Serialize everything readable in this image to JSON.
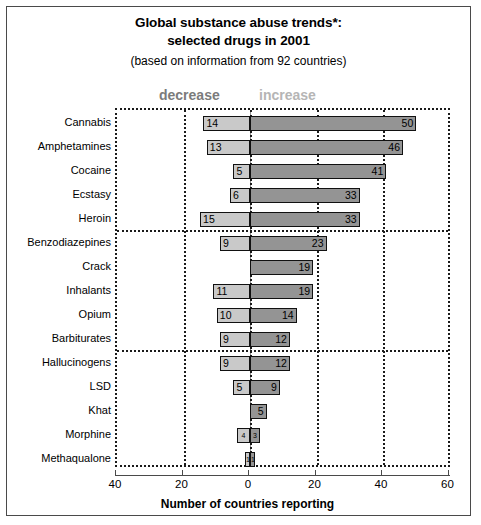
{
  "chart_data": {
    "type": "bar",
    "orientation": "horizontal",
    "style": "diverging-stacked",
    "title": "Global substance abuse trends*:",
    "title_line2": "selected drugs in 2001",
    "subtitle": "(based on information from 92 countries)",
    "xlabel": "Number of countries reporting",
    "ylabel": "",
    "xlim": [
      -40,
      60
    ],
    "xticks": [
      -40,
      -20,
      0,
      20,
      40,
      60
    ],
    "xticklabels": [
      "40",
      "20",
      "0",
      "20",
      "40",
      "60"
    ],
    "grid": "dotted vertical gridlines and dotted horizontal group separators",
    "legend_position": "above plot",
    "legend": [
      {
        "name": "decrease",
        "color": "#c9c9c9",
        "label_color": "#7b7b7b",
        "side": "left"
      },
      {
        "name": "increase",
        "color": "#949494",
        "label_color": "#b5b5b5",
        "side": "right"
      }
    ],
    "categories": [
      "Cannabis",
      "Amphetamines",
      "Cocaine",
      "Ecstasy",
      "Heroin",
      "Benzodiazepines",
      "Crack",
      "Inhalants",
      "Opium",
      "Barbiturates",
      "Hallucinogens",
      "LSD",
      "Khat",
      "Morphine",
      "Methaqualone"
    ],
    "series": [
      {
        "name": "decrease",
        "values": [
          14,
          13,
          5,
          6,
          15,
          9,
          0,
          11,
          10,
          9,
          9,
          5,
          0,
          4,
          1
        ]
      },
      {
        "name": "increase",
        "values": [
          50,
          46,
          41,
          33,
          33,
          23,
          19,
          19,
          14,
          12,
          12,
          9,
          5,
          3,
          1
        ]
      }
    ],
    "group_separators_after": [
      "Heroin",
      "Barbiturates"
    ],
    "rows": [
      {
        "category": "Cannabis",
        "decrease": 14,
        "decrease_label": "14",
        "increase": 50,
        "increase_label": "50"
      },
      {
        "category": "Amphetamines",
        "decrease": 13,
        "decrease_label": "13",
        "increase": 46,
        "increase_label": "46"
      },
      {
        "category": "Cocaine",
        "decrease": 5,
        "decrease_label": "5",
        "increase": 41,
        "increase_label": "41"
      },
      {
        "category": "Ecstasy",
        "decrease": 6,
        "decrease_label": "6",
        "increase": 33,
        "increase_label": "33"
      },
      {
        "category": "Heroin",
        "decrease": 15,
        "decrease_label": "15",
        "increase": 33,
        "increase_label": "33"
      },
      {
        "category": "Benzodiazepines",
        "decrease": 9,
        "decrease_label": "9",
        "increase": 23,
        "increase_label": "23"
      },
      {
        "category": "Crack",
        "decrease": 0,
        "decrease_label": "",
        "increase": 19,
        "increase_label": "19"
      },
      {
        "category": "Inhalants",
        "decrease": 11,
        "decrease_label": "11",
        "increase": 19,
        "increase_label": "19"
      },
      {
        "category": "Opium",
        "decrease": 10,
        "decrease_label": "10",
        "increase": 14,
        "increase_label": "14"
      },
      {
        "category": "Barbiturates",
        "decrease": 9,
        "decrease_label": "9",
        "increase": 12,
        "increase_label": "12"
      },
      {
        "category": "Hallucinogens",
        "decrease": 9,
        "decrease_label": "9",
        "increase": 12,
        "increase_label": "12"
      },
      {
        "category": "LSD",
        "decrease": 5,
        "decrease_label": "5",
        "increase": 9,
        "increase_label": "9"
      },
      {
        "category": "Khat",
        "decrease": 0,
        "decrease_label": "",
        "increase": 5,
        "increase_label": "5"
      },
      {
        "category": "Morphine",
        "decrease": 4,
        "decrease_label": "4",
        "increase": 3,
        "increase_label": "3"
      },
      {
        "category": "Methaqualone",
        "decrease": 1,
        "decrease_label": "1",
        "increase": 1,
        "increase_label": "1"
      }
    ]
  }
}
